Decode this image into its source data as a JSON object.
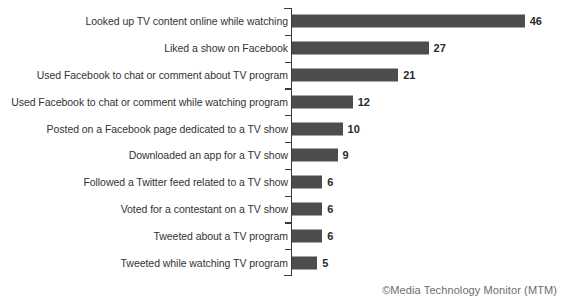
{
  "attribution": "©Media Technology Monitor (MTM)",
  "title_remnant": "",
  "colors": {
    "bar": "#4d4d4d",
    "axis": "#3a3a3a",
    "label_text": "#333333",
    "value_text": "#2b2b2b",
    "attribution_text": "#6d6d6d",
    "background": "#ffffff"
  },
  "chart_data": {
    "type": "bar",
    "orientation": "horizontal",
    "title": "",
    "xlabel": "",
    "ylabel": "",
    "xlim": [
      0,
      46
    ],
    "grid": false,
    "legend": null,
    "categories": [
      "Looked up TV content online while watching",
      "Liked a show on Facebook",
      "Used Facebook to chat or comment about TV program",
      "Used Facebook to chat or comment while watching program",
      "Posted on a Facebook page dedicated to a TV show",
      "Downloaded an app for a TV show",
      "Followed a Twitter feed related to a TV show",
      "Voted for a contestant on a TV show",
      "Tweeted about a TV program",
      "Tweeted while watching TV program"
    ],
    "values": [
      46,
      27,
      21,
      12,
      10,
      9,
      6,
      6,
      6,
      5
    ],
    "value_labels": [
      "46",
      "27",
      "21",
      "12",
      "10",
      "9",
      "6",
      "6",
      "6",
      "5"
    ]
  }
}
